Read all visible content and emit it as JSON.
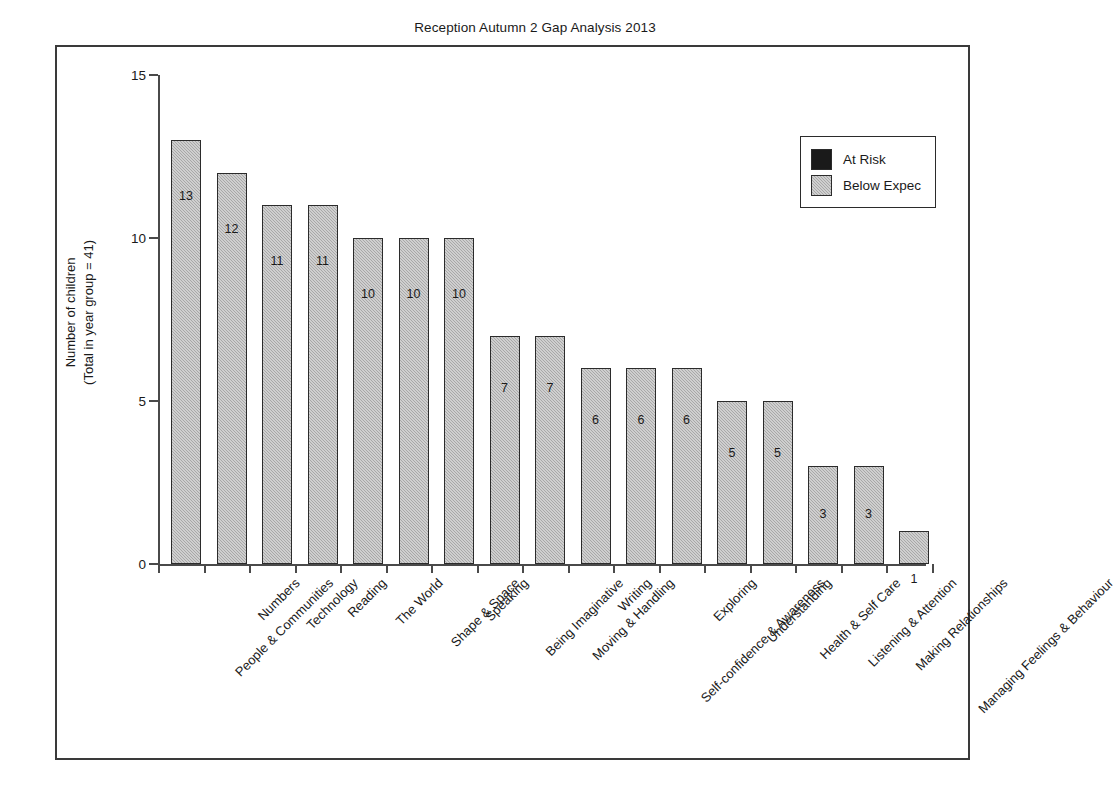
{
  "chart_data": {
    "type": "bar",
    "title": "Reception Autumn 2 Gap Analysis 2013",
    "xlabel": "",
    "ylabel": "Number of children\n(Total in year group = 41)",
    "ylabel_line1": "Number of children",
    "ylabel_line2": "(Total in year group = 41)",
    "ylim": [
      0,
      15
    ],
    "yticks": [
      0,
      5,
      10,
      15
    ],
    "ytick_labels": [
      "0",
      "5",
      "10",
      "15"
    ],
    "grid": false,
    "legend_position": "upper right",
    "categories": [
      "People & Communities",
      "Numbers",
      "Technology",
      "Reading",
      "The World",
      "Shape & Space",
      "Speaking",
      "Being Imaginative",
      "Moving & Handling",
      "Writing",
      "Self-confidence & Awareness",
      "Exploring",
      "Understanding",
      "Health & Self Care",
      "Listening & Attention",
      "Making Relationships",
      "Managing Feelings & Behaviour"
    ],
    "series": [
      {
        "name": "At Risk",
        "color": "#1a1a1a",
        "values": [
          0,
          0,
          0,
          0,
          0,
          0,
          0,
          0,
          0,
          0,
          0,
          0,
          0,
          0,
          0,
          0,
          0
        ]
      },
      {
        "name": "Below Expec",
        "color": "#a8a8a8",
        "values": [
          13,
          12,
          11,
          11,
          10,
          10,
          10,
          7,
          7,
          6,
          6,
          6,
          5,
          5,
          3,
          3,
          1
        ]
      }
    ],
    "data_labels": [
      "13",
      "12",
      "11",
      "11",
      "10",
      "10",
      "10",
      "7",
      "7",
      "6",
      "6",
      "6",
      "5",
      "5",
      "3",
      "3",
      "1"
    ]
  },
  "legend": {
    "items": [
      {
        "label": "At Risk",
        "swatch": "at-risk"
      },
      {
        "label": "Below Expec",
        "swatch": "below-expec"
      }
    ]
  }
}
